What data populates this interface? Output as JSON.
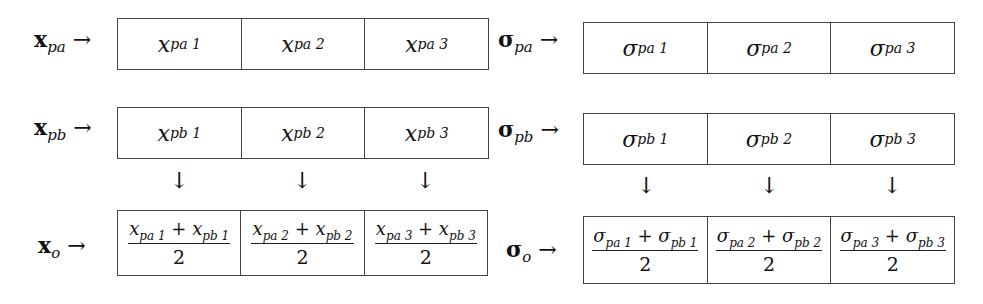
{
  "left": {
    "rows": [
      {
        "label_base": "x",
        "label_sub": "pa",
        "arrow": "→",
        "cells": [
          {
            "base": "x",
            "sub": "pa",
            "idx": "1"
          },
          {
            "base": "x",
            "sub": "pa",
            "idx": "2"
          },
          {
            "base": "x",
            "sub": "pa",
            "idx": "3"
          }
        ]
      },
      {
        "label_base": "x",
        "label_sub": "pb",
        "arrow": "→",
        "cells": [
          {
            "base": "x",
            "sub": "pb",
            "idx": "1"
          },
          {
            "base": "x",
            "sub": "pb",
            "idx": "2"
          },
          {
            "base": "x",
            "sub": "pb",
            "idx": "3"
          }
        ]
      }
    ],
    "down_arrows": [
      "↓",
      "↓",
      "↓"
    ],
    "output": {
      "label_base": "x",
      "label_sub": "o",
      "arrow": "→",
      "cells": [
        {
          "num": "x_pa1 + x_pb1",
          "a_base": "x",
          "a_sub": "pa",
          "a_idx": "1",
          "plus": "+",
          "b_base": "x",
          "b_sub": "pb",
          "b_idx": "1",
          "den": "2"
        },
        {
          "num": "x_pa2 + x_pb2",
          "a_base": "x",
          "a_sub": "pa",
          "a_idx": "2",
          "plus": "+",
          "b_base": "x",
          "b_sub": "pb",
          "b_idx": "2",
          "den": "2"
        },
        {
          "num": "x_pa3 + x_pb3",
          "a_base": "x",
          "a_sub": "pa",
          "a_idx": "3",
          "plus": "+",
          "b_base": "x",
          "b_sub": "pb",
          "b_idx": "3",
          "den": "2"
        }
      ]
    }
  },
  "right": {
    "rows": [
      {
        "label_base": "σ",
        "label_sub": "pa",
        "arrow": "→",
        "cells": [
          {
            "base": "σ",
            "sub": "pa",
            "idx": "1"
          },
          {
            "base": "σ",
            "sub": "pa",
            "idx": "2"
          },
          {
            "base": "σ",
            "sub": "pa",
            "idx": "3"
          }
        ]
      },
      {
        "label_base": "σ",
        "label_sub": "pb",
        "arrow": "→",
        "cells": [
          {
            "base": "σ",
            "sub": "pb",
            "idx": "1"
          },
          {
            "base": "σ",
            "sub": "pb",
            "idx": "2"
          },
          {
            "base": "σ",
            "sub": "pb",
            "idx": "3"
          }
        ]
      }
    ],
    "down_arrows": [
      "↓",
      "↓",
      "↓"
    ],
    "output": {
      "label_base": "σ",
      "label_sub": "o",
      "arrow": "→",
      "cells": [
        {
          "num": "σ_pa1 + σ_pb1",
          "a_base": "σ",
          "a_sub": "pa",
          "a_idx": "1",
          "plus": "+",
          "b_base": "σ",
          "b_sub": "pb",
          "b_idx": "1",
          "den": "2"
        },
        {
          "num": "σ_pa2 + σ_pb2",
          "a_base": "σ",
          "a_sub": "pa",
          "a_idx": "2",
          "plus": "+",
          "b_base": "σ",
          "b_sub": "pb",
          "b_idx": "2",
          "den": "2"
        },
        {
          "num": "σ_pa3 + σ_pb3",
          "a_base": "σ",
          "a_sub": "pa",
          "a_idx": "3",
          "plus": "+",
          "b_base": "σ",
          "b_sub": "pb",
          "b_idx": "3",
          "den": "2"
        }
      ]
    }
  }
}
